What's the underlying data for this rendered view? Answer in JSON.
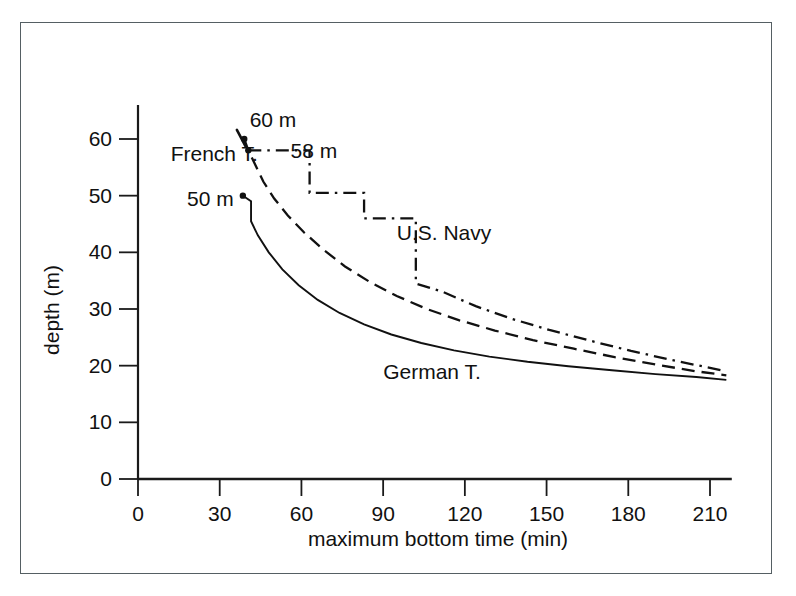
{
  "chart_data": {
    "type": "line",
    "title": "",
    "xlabel": "maximum bottom time (min)",
    "ylabel": "depth (m)",
    "xlim": [
      0,
      218
    ],
    "ylim": [
      0,
      66
    ],
    "x_ticks": [
      0,
      30,
      60,
      90,
      120,
      150,
      180,
      210
    ],
    "y_ticks": [
      0,
      10,
      20,
      30,
      40,
      50,
      60
    ],
    "x_tick_labels": [
      "0",
      "30",
      "60",
      "90",
      "120",
      "150",
      "180",
      "210"
    ],
    "y_tick_labels": [
      "0",
      "10",
      "20",
      "30",
      "40",
      "50",
      "60"
    ],
    "grid": false,
    "legend_position": "inline-annotations",
    "annotations": [
      {
        "text": "60 m",
        "x": 41,
        "y": 65.5
      },
      {
        "text": "58 m",
        "x": 56,
        "y": 60.0
      },
      {
        "text": "50 m",
        "x": 18,
        "y": 51.5
      },
      {
        "text": "French T.",
        "x": 12,
        "y": 59.5
      },
      {
        "text": "U.S. Navy",
        "x": 95,
        "y": 45.5
      },
      {
        "text": "German T.",
        "x": 90,
        "y": 21.0
      }
    ],
    "series": [
      {
        "name": "French T.",
        "style": "dashed",
        "start_label": "60 m",
        "points": [
          [
            39.0,
            60.0
          ],
          [
            40.5,
            58.0
          ],
          [
            43.0,
            55.5
          ],
          [
            46.0,
            52.5
          ],
          [
            50.0,
            49.5
          ],
          [
            55.0,
            46.5
          ],
          [
            61.0,
            43.5
          ],
          [
            68.0,
            40.5
          ],
          [
            76.0,
            37.5
          ],
          [
            85.0,
            34.8
          ],
          [
            95.0,
            32.3
          ],
          [
            106.0,
            30.0
          ],
          [
            118.0,
            28.0
          ],
          [
            131.0,
            26.2
          ],
          [
            145.0,
            24.5
          ],
          [
            160.0,
            23.0
          ],
          [
            175.0,
            21.5
          ],
          [
            190.0,
            20.2
          ],
          [
            205.0,
            19.0
          ],
          [
            216.0,
            18.3
          ]
        ]
      },
      {
        "name": "U.S. Navy",
        "style": "dash-dot",
        "start_label": "58 m",
        "step": true,
        "points": [
          [
            40.5,
            58.0
          ],
          [
            63.0,
            58.0
          ],
          [
            63.0,
            50.5
          ],
          [
            83.0,
            50.5
          ],
          [
            83.0,
            46.0
          ],
          [
            102.0,
            46.0
          ],
          [
            102.0,
            34.5
          ],
          [
            112.0,
            33.0
          ],
          [
            124.0,
            30.5
          ],
          [
            137.0,
            28.3
          ],
          [
            151.0,
            26.3
          ],
          [
            166.0,
            24.4
          ],
          [
            181.0,
            22.6
          ],
          [
            196.0,
            21.0
          ],
          [
            210.0,
            19.6
          ],
          [
            216.0,
            19.0
          ]
        ]
      },
      {
        "name": "German T.",
        "style": "solid",
        "start_label": "50 m",
        "points": [
          [
            38.5,
            50.0
          ],
          [
            41.5,
            49.0
          ],
          [
            41.5,
            45.5
          ],
          [
            44.0,
            43.0
          ],
          [
            48.0,
            40.0
          ],
          [
            53.0,
            37.0
          ],
          [
            59.0,
            34.2
          ],
          [
            66.0,
            31.6
          ],
          [
            74.0,
            29.3
          ],
          [
            83.0,
            27.3
          ],
          [
            93.0,
            25.5
          ],
          [
            104.0,
            24.0
          ],
          [
            116.0,
            22.7
          ],
          [
            129.0,
            21.6
          ],
          [
            143.0,
            20.7
          ],
          [
            158.0,
            19.9
          ],
          [
            174.0,
            19.2
          ],
          [
            190.0,
            18.5
          ],
          [
            205.0,
            18.0
          ],
          [
            216.0,
            17.5
          ]
        ]
      }
    ]
  },
  "figure": {
    "border_color": "#555f63",
    "axis_color": "#1a1a1a",
    "line_color": "#111111",
    "background": "#ffffff"
  }
}
